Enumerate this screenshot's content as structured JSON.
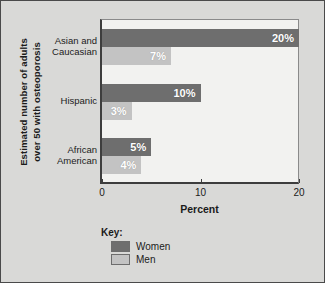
{
  "chart_data": {
    "type": "bar",
    "orientation": "horizontal",
    "title": "",
    "xlabel": "Percent",
    "ylabel": "Estimated number of adults over 50 with osteoporosis",
    "ylabel_lines": [
      "Estimated number of adults",
      "over 50 with osteoporosis"
    ],
    "categories": [
      "Asian and Caucasian",
      "Hispanic",
      "African American"
    ],
    "category_lines": [
      [
        "Asian and",
        "Caucasian"
      ],
      [
        "Hispanic"
      ],
      [
        "African",
        "American"
      ]
    ],
    "series": [
      {
        "name": "Women",
        "color": "#6e6e6e",
        "values": [
          20,
          10,
          5
        ],
        "labels": [
          "20%",
          "10%",
          "5%"
        ]
      },
      {
        "name": "Men",
        "color": "#c3c3c3",
        "values": [
          7,
          3,
          4
        ],
        "labels": [
          "7%",
          "3%",
          "4%"
        ]
      }
    ],
    "xlim": [
      0,
      20
    ],
    "xticks": [
      0,
      10,
      20
    ],
    "xtick_labels": [
      "0",
      "10",
      "20"
    ],
    "grid": false,
    "legend_position": "below-plot",
    "legend_title": "Key:",
    "legend_entries": [
      {
        "label": "Women",
        "color": "#6e6e6e"
      },
      {
        "label": "Men",
        "color": "#c3c3c3"
      }
    ],
    "value_unit": "%"
  },
  "colors": {
    "page_background": "#d9d9d7",
    "plot_background": "#f2f2f0",
    "frame": "#4a4a4a",
    "axis": "#3d3d3d",
    "women": "#6e6e6e",
    "men": "#c3c3c3",
    "text": "#1b1b1b",
    "value_label": "#ffffff"
  }
}
